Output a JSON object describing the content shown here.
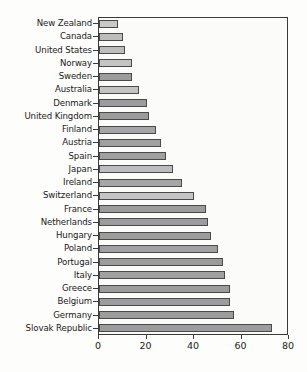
{
  "chart_data": {
    "type": "bar",
    "orientation": "horizontal",
    "title": "",
    "xlabel": "",
    "ylabel": "",
    "xlim": [
      0,
      80
    ],
    "xticks": [
      0,
      20,
      40,
      60,
      80
    ],
    "grid": false,
    "legend": null,
    "categories": [
      "New Zealand",
      "Canada",
      "United States",
      "Norway",
      "Sweden",
      "Australia",
      "Denmark",
      "United Kingdom",
      "Finland",
      "Austria",
      "Spain",
      "Japan",
      "Ireland",
      "Switzerland",
      "France",
      "Netherlands",
      "Hungary",
      "Poland",
      "Portugal",
      "Italy",
      "Greece",
      "Belgium",
      "Germany",
      "Slovak Republic"
    ],
    "values": [
      8,
      10,
      11,
      14,
      14,
      17,
      20,
      21,
      24,
      26,
      28,
      31,
      35,
      40,
      45,
      46,
      47,
      50,
      52,
      53,
      55,
      55,
      57,
      73
    ],
    "bar_colors": [
      "#c9c9c9",
      "#bdbdbd",
      "#bdbdbd",
      "#c4c4c4",
      "#9c9c9c",
      "#c4c4c4",
      "#9c9c9c",
      "#9c9c9c",
      "#a6a6a6",
      "#a0a0a0",
      "#a0a0a0",
      "#bdbdbd",
      "#a6a6a6",
      "#c4c4c4",
      "#9c9c9c",
      "#9c9c9c",
      "#9c9c9c",
      "#a0a0a0",
      "#9c9c9c",
      "#a0a0a0",
      "#9c9c9c",
      "#9c9c9c",
      "#9c9c9c",
      "#9c9c9c"
    ]
  },
  "style": {
    "page_background": "#fdfdfb",
    "plot_background": "#fbfbf9",
    "frame_color": "#3a3a3a",
    "bar_border": "#4a4a4a",
    "text_color": "#1a1a1a"
  }
}
